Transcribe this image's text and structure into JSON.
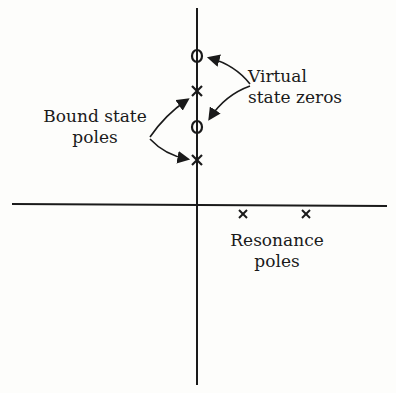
{
  "diagram": {
    "type": "pole-zero plot (complex plane)",
    "labels": {
      "virtual_line1": "Virtual",
      "virtual_line2": "state zeros",
      "bound_line1": "Bound state",
      "bound_line2": "poles",
      "resonance_line1": "Resonance",
      "resonance_line2": "poles"
    },
    "markers": {
      "zeros_on_imag_axis": 2,
      "bound_state_poles_on_imag_axis": 2,
      "resonance_poles_below_real_axis": 2
    },
    "colors": {
      "ink": "#1a1a1a",
      "background": "#fdfdfb"
    }
  }
}
